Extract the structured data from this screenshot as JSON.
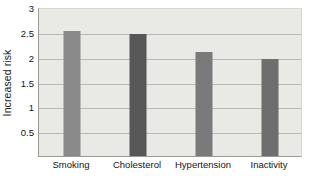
{
  "chart_data": {
    "type": "bar",
    "title": "",
    "xlabel": "",
    "ylabel": "Increased risk",
    "categories": [
      "Smoking",
      "Cholesterol",
      "Hypertension",
      "Inactivity"
    ],
    "values": [
      2.52,
      2.45,
      2.1,
      1.96
    ],
    "series": [
      {
        "name": "Increased risk",
        "values": [
          2.52,
          2.45,
          2.1,
          1.96
        ]
      }
    ],
    "ylim": [
      0,
      3
    ],
    "ytick_values": [
      0.5,
      1,
      1.5,
      2,
      2.5,
      3
    ],
    "ytick_labels": [
      "0.5",
      "1",
      "1.5",
      "2",
      "2.5",
      "3"
    ],
    "grid": true,
    "grid_axis": "y",
    "legend": false,
    "legend_position": "none",
    "bar_colors": [
      "#8a8a8a",
      "#575757",
      "#7a7a7a",
      "#6e6e6e"
    ],
    "plot_background": "#e9e9e6",
    "gridline_color": "#b9b9b5",
    "axis_color": "#9a9a97",
    "text_color": "#141414"
  }
}
